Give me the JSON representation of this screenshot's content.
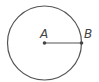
{
  "diagram": {
    "type": "circle-radius",
    "circle": {
      "cx": 44.5,
      "cy": 43,
      "r": 37,
      "stroke": "#555555"
    },
    "points": [
      {
        "label": "A",
        "role": "center",
        "x": 44.5,
        "y": 43
      },
      {
        "label": "B",
        "role": "on-circumference",
        "x": 81.5,
        "y": 43
      }
    ],
    "segments": [
      {
        "from": "A",
        "to": "B"
      }
    ]
  },
  "labels": {
    "a": "A",
    "b": "B"
  }
}
